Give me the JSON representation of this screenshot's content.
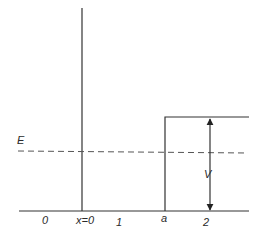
{
  "diagram": {
    "type": "potential-step",
    "labels": {
      "energy": "E",
      "potential": "V",
      "region_0": "0",
      "origin": "x=0",
      "region_1": "1",
      "step_position": "a",
      "region_2": "2"
    },
    "colors": {
      "line": "#333333",
      "dashed": "#555555",
      "text": "#2a2a2a",
      "background": "#ffffff"
    }
  }
}
